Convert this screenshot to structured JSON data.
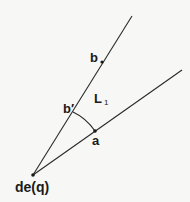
{
  "diagram": {
    "type": "geometric-angle-construction",
    "background_color": "#f7f7f5",
    "stroke_color": "#2a2a2a",
    "apex": {
      "label": "de(q)",
      "x": 33,
      "y": 175
    },
    "rays": [
      {
        "name": "upper-ray",
        "from": [
          33,
          175
        ],
        "to": [
          132,
          16
        ]
      },
      {
        "name": "lower-ray",
        "from": [
          33,
          175
        ],
        "to": [
          182,
          70
        ]
      }
    ],
    "points": [
      {
        "name": "b",
        "label": "b",
        "x": 102,
        "y": 62,
        "on": "upper-ray"
      },
      {
        "name": "b-prime",
        "label": "b′",
        "x": 73,
        "y": 112,
        "on": "upper-ray"
      },
      {
        "name": "a",
        "label": "a",
        "x": 95,
        "y": 131,
        "on": "lower-ray"
      }
    ],
    "arc": {
      "from": "b-prime",
      "to": "a",
      "center": "apex"
    },
    "region_label": {
      "main": "L",
      "subscript": "1"
    }
  }
}
